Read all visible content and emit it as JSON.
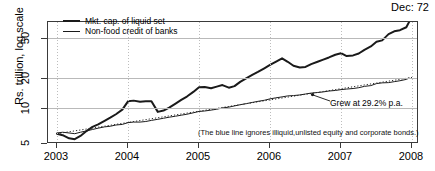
{
  "chart_data": {
    "type": "line",
    "title": "Dec: 72",
    "xlabel": "",
    "ylabel": "Rs. trillion, log scale",
    "yscale": "log",
    "ylim": [
      4.6,
      80
    ],
    "xlim": [
      2003.0,
      2008.0
    ],
    "yticks": [
      5,
      10,
      20,
      50
    ],
    "ytick_labels": [
      "5",
      "10",
      "20",
      "50"
    ],
    "xticks": [
      2003,
      2004,
      2005,
      2006,
      2007,
      2008
    ],
    "xtick_labels": [
      "2003",
      "2004",
      "2005",
      "2006",
      "2007",
      "2008"
    ],
    "grid": "horizontal solid gray, vertical dotted gray",
    "legend_position": "top-left inside",
    "series": [
      {
        "name": "Mkt. cap. of liquid set",
        "color": "#1a1a1a",
        "width": 2,
        "x": [
          2003.0,
          2003.08,
          2003.17,
          2003.25,
          2003.33,
          2003.42,
          2003.5,
          2003.58,
          2003.67,
          2003.75,
          2003.83,
          2003.92,
          2004.0,
          2004.08,
          2004.17,
          2004.25,
          2004.33,
          2004.42,
          2004.5,
          2004.58,
          2004.67,
          2004.75,
          2004.83,
          2004.92,
          2005.0,
          2005.08,
          2005.17,
          2005.25,
          2005.33,
          2005.42,
          2005.5,
          2005.58,
          2005.67,
          2005.75,
          2005.83,
          2005.92,
          2006.0,
          2006.08,
          2006.17,
          2006.25,
          2006.33,
          2006.42,
          2006.5,
          2006.58,
          2006.67,
          2006.75,
          2006.83,
          2006.92,
          2007.0,
          2007.08,
          2007.17,
          2007.25,
          2007.33,
          2007.42,
          2007.5,
          2007.58,
          2007.67,
          2007.75,
          2007.83,
          2007.92,
          2007.96
        ],
        "y": [
          6.2,
          6.0,
          5.6,
          5.5,
          5.9,
          6.6,
          7.2,
          7.6,
          8.2,
          8.8,
          9.5,
          10.5,
          12.6,
          12.8,
          12.5,
          12.6,
          12.6,
          10.0,
          10.3,
          11.0,
          12.0,
          13.0,
          14.0,
          15.5,
          17.2,
          17.3,
          16.8,
          17.4,
          18.0,
          17.0,
          17.6,
          19.3,
          21.0,
          22.5,
          24.0,
          26.0,
          28.0,
          30.0,
          32.4,
          30.0,
          27.5,
          26.5,
          26.8,
          28.5,
          30.0,
          31.5,
          33.0,
          35.0,
          36.2,
          34.0,
          34.5,
          36.0,
          39.0,
          42.0,
          46.5,
          48.0,
          55.0,
          58.5,
          60.0,
          64.0,
          72.0
        ]
      },
      {
        "name": "Non-food credit of banks",
        "color": "#1a1a1a",
        "width": 1,
        "x": [
          2003.0,
          2003.08,
          2003.17,
          2003.25,
          2003.33,
          2003.42,
          2003.5,
          2003.58,
          2003.67,
          2003.75,
          2003.83,
          2003.92,
          2004.0,
          2004.08,
          2004.17,
          2004.25,
          2004.33,
          2004.42,
          2004.5,
          2004.58,
          2004.67,
          2004.75,
          2004.83,
          2004.92,
          2005.0,
          2005.08,
          2005.17,
          2005.25,
          2005.33,
          2005.42,
          2005.5,
          2005.58,
          2005.67,
          2005.75,
          2005.83,
          2005.92,
          2006.0,
          2006.08,
          2006.17,
          2006.25,
          2006.33,
          2006.42,
          2006.5,
          2006.58,
          2006.67,
          2006.75,
          2006.83,
          2006.92,
          2007.0,
          2007.08,
          2007.17,
          2007.25,
          2007.33,
          2007.42,
          2007.5,
          2007.58,
          2007.67,
          2007.75,
          2007.83,
          2007.92,
          2007.96
        ],
        "y": [
          6.3,
          6.4,
          6.3,
          6.2,
          6.4,
          6.6,
          6.8,
          7.0,
          7.2,
          7.3,
          7.5,
          7.6,
          7.9,
          8.0,
          8.0,
          8.1,
          8.3,
          8.5,
          8.7,
          8.9,
          9.1,
          9.3,
          9.5,
          9.8,
          10.1,
          10.2,
          10.4,
          10.6,
          10.9,
          11.1,
          11.4,
          11.7,
          12.0,
          12.3,
          12.6,
          12.9,
          13.3,
          13.6,
          13.9,
          14.2,
          14.3,
          14.5,
          14.8,
          15.1,
          15.3,
          15.5,
          15.8,
          16.0,
          16.3,
          16.5,
          16.7,
          17.0,
          17.5,
          17.8,
          18.6,
          18.9,
          19.0,
          19.4,
          19.8,
          20.4,
          21.0
        ]
      }
    ],
    "trend_overlay": {
      "name": "fitted trend (dotted)",
      "style": "dotted",
      "note": "dotted trend drawn over the non-food credit series",
      "start": [
        2003.0,
        6.2
      ],
      "end": [
        2008.0,
        21.3
      ],
      "growth_rate_pct_pa": 29.2
    },
    "annotations": [
      {
        "name": "growth-annotation",
        "text": "Grew at 29.2% p.a.",
        "pointer_from": [
          2007.35,
          16.0
        ],
        "pointer_to": [
          2006.93,
          16.2
        ]
      },
      {
        "name": "footnote-annotation",
        "text": "(The blue line ignores illiquid,unlisted equity and corporate bonds.)"
      }
    ]
  },
  "legend": {
    "items": [
      {
        "label": "Mkt. cap. of liquid set",
        "swatch": "thick-line-swatch"
      },
      {
        "label": "Non-food credit of banks",
        "swatch": "thin-line-swatch"
      }
    ]
  },
  "axes": {
    "y_title": "Rs. trillion, log scale",
    "y_tick_labels": [
      "50",
      "20",
      "10",
      "5"
    ],
    "x_tick_labels": [
      "2003",
      "2004",
      "2005",
      "2006",
      "2007",
      "2008"
    ]
  },
  "colors": {
    "series_line": "#1a1a1a",
    "hgrid": "#b9b9b9",
    "vgrid": "#bdbdbd",
    "frame": "#3a3a3a",
    "text": "#000000"
  }
}
